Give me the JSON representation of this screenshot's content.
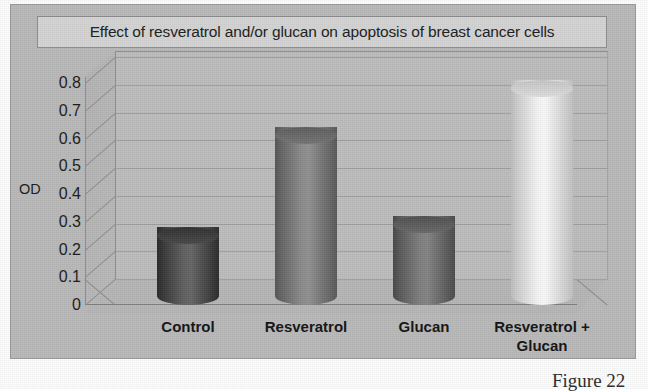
{
  "chart_data": {
    "type": "bar",
    "title": "Effect of resveratrol and/or glucan on apoptosis of breast cancer cells",
    "xlabel": "",
    "ylabel": "OD",
    "categories": [
      "Control",
      "Resveratrol",
      "Glucan",
      "Resveratrol + Glucan"
    ],
    "category_lines": [
      [
        "Control"
      ],
      [
        "Resveratrol"
      ],
      [
        "Glucan"
      ],
      [
        "Resveratrol +",
        "Glucan"
      ]
    ],
    "values": [
      0.25,
      0.61,
      0.29,
      0.78
    ],
    "ylim": [
      0,
      0.8
    ],
    "ytick_labels": [
      "0.8",
      "0.7",
      "0.6",
      "0.5",
      "0.4",
      "0.3",
      "0.2",
      "0.1",
      "0"
    ],
    "ytick_values": [
      0.8,
      0.7,
      0.6,
      0.5,
      0.4,
      0.3,
      0.2,
      0.1,
      0
    ],
    "grid": true,
    "legend": false,
    "style": "3d-cylinder",
    "bar_colors": [
      "#4f4f4f",
      "#7b7b7b",
      "#6e6e6e",
      "#e3e3e3"
    ],
    "series": [
      {
        "name": "OD",
        "points": [
          {
            "category": "Control",
            "value": 0.25
          },
          {
            "category": "Resveratrol",
            "value": 0.61
          },
          {
            "category": "Glucan",
            "value": 0.29
          },
          {
            "category": "Resveratrol + Glucan",
            "value": 0.78
          }
        ]
      }
    ]
  },
  "figure": {
    "caption": "Figure 22"
  },
  "colors": {
    "chart_background": "#b9b9b9",
    "title_box_background": "#d4d4d4",
    "gridline": "#a0a0a0",
    "axis": "#8e8e8e",
    "text": "#1c1c1c"
  }
}
